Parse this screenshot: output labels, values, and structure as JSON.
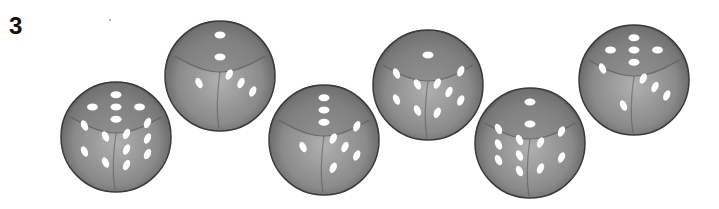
{
  "exercise": {
    "number": "3"
  },
  "colors": {
    "die_face": "#8a8a8a",
    "die_top": "#7a7a7a",
    "die_edge": "#3a3a3a",
    "pip": "#ffffff"
  },
  "dice": [
    {
      "id": 1,
      "x": 57,
      "y": 77,
      "top": 5,
      "left": 4,
      "right": 6
    },
    {
      "id": 2,
      "x": 161,
      "y": 16,
      "top": 2,
      "left": 1,
      "right": 3
    },
    {
      "id": 3,
      "x": 265,
      "y": 80,
      "top": 3,
      "left": 1,
      "right": 5
    },
    {
      "id": 4,
      "x": 369,
      "y": 25,
      "top": 1,
      "left": 4,
      "right": 5
    },
    {
      "id": 5,
      "x": 471,
      "y": 83,
      "top": 2,
      "left": 6,
      "right": 4
    },
    {
      "id": 6,
      "x": 575,
      "y": 20,
      "top": 5,
      "left": 2,
      "right": 3
    }
  ]
}
